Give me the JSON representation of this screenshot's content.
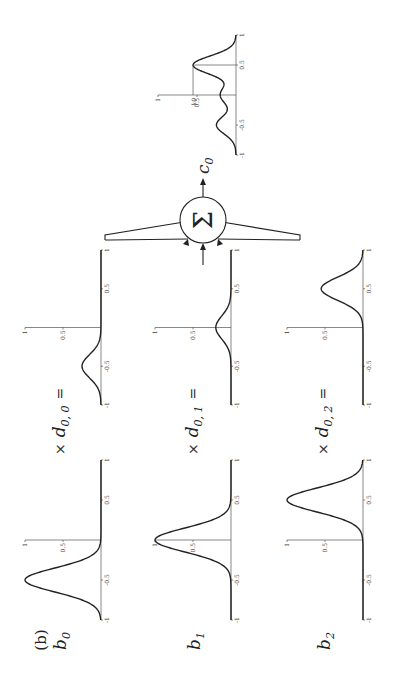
{
  "panel_label": "(b)",
  "sum_symbol": "Σ",
  "output": {
    "symbol": "c",
    "subscript": "0"
  },
  "multiply_symbol": "×",
  "equals_symbol": "=",
  "rows": [
    {
      "basis": {
        "symbol": "b",
        "subscript": "0"
      },
      "coef": {
        "symbol": "d",
        "subscript": "0, 0"
      },
      "basis_center": -0.5,
      "coefficient": 0.25
    },
    {
      "basis": {
        "symbol": "b",
        "subscript": "1"
      },
      "coef": {
        "symbol": "d",
        "subscript": "0, 1"
      },
      "basis_center": 0.0,
      "coefficient": 0.2
    },
    {
      "basis": {
        "symbol": "b",
        "subscript": "2"
      },
      "coef": {
        "symbol": "d",
        "subscript": "0, 2"
      },
      "basis_center": 0.5,
      "coefficient": 0.55
    }
  ],
  "axes": {
    "x_ticks": [
      "-1",
      "-0.5",
      "0.5",
      "1"
    ],
    "y_ticks": [
      "0.5",
      "1"
    ],
    "x_range": [
      -1,
      1
    ],
    "y_range": [
      0,
      1
    ]
  },
  "basis_width": 0.15,
  "result": {
    "marker_label": "k",
    "marker_subscript": "0",
    "marker_x": 0.5
  }
}
